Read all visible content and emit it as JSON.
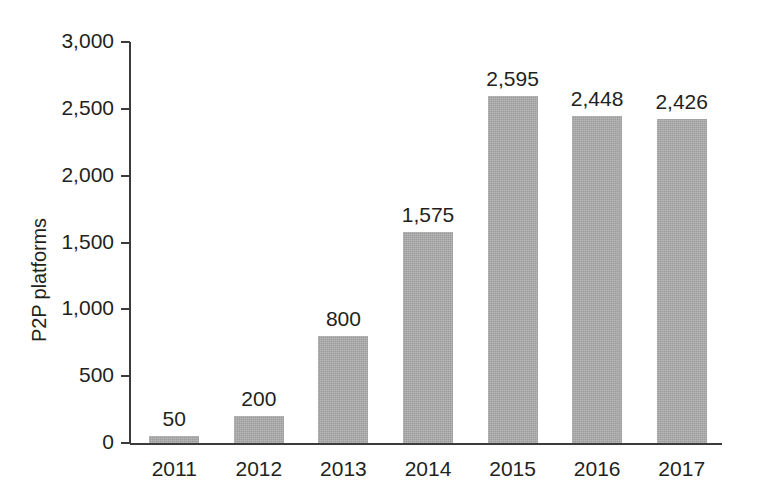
{
  "chart_data": {
    "type": "bar",
    "title": "",
    "xlabel": "",
    "ylabel": "P2P platforms",
    "categories": [
      "2011",
      "2012",
      "2013",
      "2014",
      "2015",
      "2016",
      "2017"
    ],
    "values": [
      50,
      200,
      800,
      1575,
      2595,
      2448,
      2426
    ],
    "value_labels": [
      "50",
      "200",
      "800",
      "1,575",
      "2,595",
      "2,448",
      "2,426"
    ],
    "ylim": [
      0,
      3000
    ],
    "ytick_values": [
      3000,
      2500,
      2000,
      1500,
      1000,
      500,
      0
    ],
    "ytick_labels": [
      "3,000",
      "2,500",
      "2,000",
      "1,500",
      "1,000",
      "500",
      "0"
    ],
    "grid": false,
    "legend": null,
    "bar_color": "#a7a7a7",
    "axis_color": "#3b3b3b",
    "text_color": "#231f20"
  }
}
